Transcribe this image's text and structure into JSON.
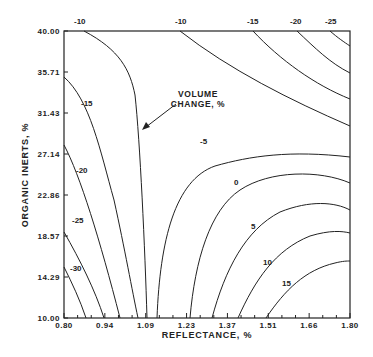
{
  "chart_data": {
    "type": "contour",
    "title": "",
    "xlabel": "REFLECTANCE, %",
    "ylabel": "ORGANIC INERTS, %",
    "xlim": [
      0.8,
      1.8
    ],
    "ylim": [
      10.0,
      40.0
    ],
    "x_ticks": [
      "0.80",
      "0.94",
      "1.09",
      "1.23",
      "1.37",
      "1.51",
      "1.66",
      "1.80"
    ],
    "y_ticks": [
      "40.00",
      "35.71",
      "31.43",
      "27.14",
      "22.86",
      "18.57",
      "14.29",
      "10.00"
    ],
    "annotation": {
      "line1": "VOLUME",
      "line2": "CHANGE, %"
    },
    "contour_levels": [
      -30,
      -25,
      -20,
      -15,
      -10,
      -5,
      0,
      5,
      10,
      15
    ],
    "contours": [
      {
        "level": "-30",
        "label": "-30",
        "path": "M64,267 C72,283 80,300 86,318",
        "lx": 70,
        "ly": 271
      },
      {
        "level": "-25",
        "label": "-25",
        "path": "M64,232 C80,260 95,290 104,318",
        "lx": 72,
        "ly": 223
      },
      {
        "level": "-20",
        "label": "-20",
        "path": "M64,145 C80,175 100,240 120,318",
        "lx": 76,
        "ly": 173
      },
      {
        "level": "-15",
        "label": "-15",
        "path": "M64,77 C90,100 100,150 114,200 C125,250 132,290 138,318",
        "lx": 81,
        "ly": 106
      },
      {
        "level": "-10 (left)",
        "label": "-10",
        "path": "M84,31 C120,50 130,70 135,95 C140,140 145,250 147,318",
        "lx": 74,
        "ly": 24
      },
      {
        "level": "-10 (right)",
        "label": "-10",
        "path": "M180,31 C230,70 290,100 350,126",
        "lx": 175,
        "ly": 24
      },
      {
        "level": "-15",
        "label": "-15",
        "path": "M253,31 C280,60 315,85 350,99",
        "lx": 247,
        "ly": 24
      },
      {
        "level": "-20",
        "label": "-20",
        "path": "M297,31 C315,48 330,63 350,73",
        "lx": 290,
        "ly": 24
      },
      {
        "level": "-25",
        "label": "-25",
        "path": "M330,31 C338,38 344,42 350,46",
        "lx": 325,
        "ly": 24
      },
      {
        "level": "-5",
        "label": "-5",
        "path": "M157,318 C160,240 175,180 215,166 C250,156 290,150 350,157",
        "lx": 200,
        "ly": 144
      },
      {
        "level": "0",
        "label": "0",
        "path": "M190,318 C195,260 210,210 240,190 C270,170 320,170 350,183",
        "lx": 234,
        "ly": 185
      },
      {
        "level": "5",
        "label": "5",
        "path": "M212,318 C225,270 245,230 280,212 C310,200 335,202 350,210",
        "lx": 251,
        "ly": 229
      },
      {
        "level": "10",
        "label": "10",
        "path": "M238,318 C255,280 275,250 310,236 C330,230 342,231 350,233",
        "lx": 263,
        "ly": 265
      },
      {
        "level": "15",
        "label": "15",
        "path": "M266,318 C285,290 305,270 335,263 C343,261 347,261 350,261",
        "lx": 282,
        "ly": 286
      }
    ]
  }
}
